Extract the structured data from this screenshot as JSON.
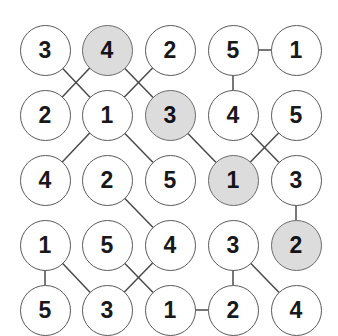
{
  "graph": {
    "title": "Node Grid Graph",
    "node_radius": 25.5,
    "rows": 5,
    "cols": 5,
    "col_x": [
      45,
      107,
      170,
      233,
      296
    ],
    "row_y": [
      50,
      115,
      180,
      245,
      310
    ],
    "colors": {
      "background": "#ffffff",
      "node_fill": "#ffffff",
      "node_fill_shaded": "#dcdcdc",
      "node_stroke": "#59595b",
      "edge_stroke": "#4a4a4c",
      "label_color": "#19191b"
    },
    "nodes": [
      {
        "id": "n-0-0",
        "row": 0,
        "col": 0,
        "label": "3",
        "shaded": false
      },
      {
        "id": "n-0-1",
        "row": 0,
        "col": 1,
        "label": "4",
        "shaded": true
      },
      {
        "id": "n-0-2",
        "row": 0,
        "col": 2,
        "label": "2",
        "shaded": false
      },
      {
        "id": "n-0-3",
        "row": 0,
        "col": 3,
        "label": "5",
        "shaded": false
      },
      {
        "id": "n-0-4",
        "row": 0,
        "col": 4,
        "label": "1",
        "shaded": false
      },
      {
        "id": "n-1-0",
        "row": 1,
        "col": 0,
        "label": "2",
        "shaded": false
      },
      {
        "id": "n-1-1",
        "row": 1,
        "col": 1,
        "label": "1",
        "shaded": false
      },
      {
        "id": "n-1-2",
        "row": 1,
        "col": 2,
        "label": "3",
        "shaded": true
      },
      {
        "id": "n-1-3",
        "row": 1,
        "col": 3,
        "label": "4",
        "shaded": false
      },
      {
        "id": "n-1-4",
        "row": 1,
        "col": 4,
        "label": "5",
        "shaded": false
      },
      {
        "id": "n-2-0",
        "row": 2,
        "col": 0,
        "label": "4",
        "shaded": false
      },
      {
        "id": "n-2-1",
        "row": 2,
        "col": 1,
        "label": "2",
        "shaded": false
      },
      {
        "id": "n-2-2",
        "row": 2,
        "col": 2,
        "label": "5",
        "shaded": false
      },
      {
        "id": "n-2-3",
        "row": 2,
        "col": 3,
        "label": "1",
        "shaded": true
      },
      {
        "id": "n-2-4",
        "row": 2,
        "col": 4,
        "label": "3",
        "shaded": false
      },
      {
        "id": "n-3-0",
        "row": 3,
        "col": 0,
        "label": "1",
        "shaded": false
      },
      {
        "id": "n-3-1",
        "row": 3,
        "col": 1,
        "label": "5",
        "shaded": false
      },
      {
        "id": "n-3-2",
        "row": 3,
        "col": 2,
        "label": "4",
        "shaded": false
      },
      {
        "id": "n-3-3",
        "row": 3,
        "col": 3,
        "label": "3",
        "shaded": false
      },
      {
        "id": "n-3-4",
        "row": 3,
        "col": 4,
        "label": "2",
        "shaded": true
      },
      {
        "id": "n-4-0",
        "row": 4,
        "col": 0,
        "label": "5",
        "shaded": false
      },
      {
        "id": "n-4-1",
        "row": 4,
        "col": 1,
        "label": "3",
        "shaded": false
      },
      {
        "id": "n-4-2",
        "row": 4,
        "col": 2,
        "label": "1",
        "shaded": false
      },
      {
        "id": "n-4-3",
        "row": 4,
        "col": 3,
        "label": "2",
        "shaded": false
      },
      {
        "id": "n-4-4",
        "row": 4,
        "col": 4,
        "label": "4",
        "shaded": false
      }
    ],
    "edges": [
      {
        "from": "n-0-0",
        "to": "n-1-1"
      },
      {
        "from": "n-0-1",
        "to": "n-1-0"
      },
      {
        "from": "n-0-1",
        "to": "n-1-2"
      },
      {
        "from": "n-0-2",
        "to": "n-1-1"
      },
      {
        "from": "n-0-3",
        "to": "n-0-4"
      },
      {
        "from": "n-0-3",
        "to": "n-1-3"
      },
      {
        "from": "n-1-1",
        "to": "n-2-0"
      },
      {
        "from": "n-1-1",
        "to": "n-2-2"
      },
      {
        "from": "n-1-2",
        "to": "n-2-3"
      },
      {
        "from": "n-1-3",
        "to": "n-2-4"
      },
      {
        "from": "n-1-4",
        "to": "n-2-3"
      },
      {
        "from": "n-2-1",
        "to": "n-3-2"
      },
      {
        "from": "n-2-4",
        "to": "n-3-4"
      },
      {
        "from": "n-3-0",
        "to": "n-4-0"
      },
      {
        "from": "n-3-0",
        "to": "n-4-1"
      },
      {
        "from": "n-3-1",
        "to": "n-4-2"
      },
      {
        "from": "n-3-2",
        "to": "n-4-1"
      },
      {
        "from": "n-3-3",
        "to": "n-4-3"
      },
      {
        "from": "n-3-3",
        "to": "n-4-4"
      },
      {
        "from": "n-4-2",
        "to": "n-4-3"
      }
    ]
  }
}
